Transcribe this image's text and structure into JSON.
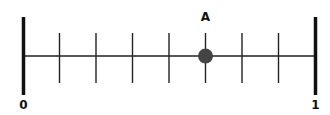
{
  "diagram": {
    "type": "number-line",
    "start_label": "0",
    "end_label": "1",
    "start_value": 0,
    "end_value": 1,
    "divisions": 8,
    "point": {
      "label": "A",
      "tick_index": 5,
      "value": "5/8",
      "color": "#444444"
    },
    "line_color": "#222222",
    "endpoint_color": "#111111"
  }
}
